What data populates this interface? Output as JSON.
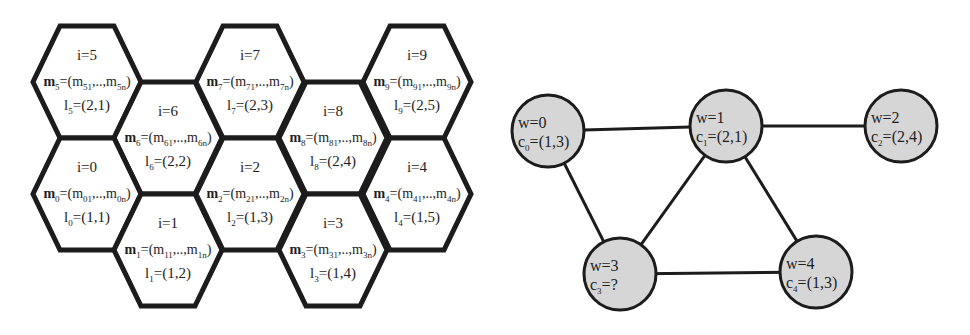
{
  "colors": {
    "stroke": "#1c1c1c",
    "node_fill": "#d6d6d6",
    "hex_fill": "#ffffff",
    "background": "#ffffff"
  },
  "hex_grid": {
    "geometry": {
      "half_width": 54,
      "half_height": 56,
      "top_half": 27
    },
    "cells": [
      {
        "i": "5",
        "cx": 87,
        "cy": 82,
        "i_label": "i=5",
        "m_sym": "m",
        "m_sub": "5",
        "m_rest": "=(m",
        "m_first": "51",
        "m_mid": ",..,m",
        "m_last": "5n",
        "m_close": ")",
        "l_sym": "l",
        "l_sub": "5",
        "l_val": "=(2,1)"
      },
      {
        "i": "6",
        "cx": 168,
        "cy": 138,
        "i_label": "i=6",
        "m_sym": "m",
        "m_sub": "6",
        "m_rest": "=(m",
        "m_first": "61",
        "m_mid": ",..,m",
        "m_last": "6n",
        "m_close": ")",
        "l_sym": "l",
        "l_sub": "6",
        "l_val": "=(2,2)"
      },
      {
        "i": "7",
        "cx": 250,
        "cy": 82,
        "i_label": "i=7",
        "m_sym": "m",
        "m_sub": "7",
        "m_rest": "=(m",
        "m_first": "71",
        "m_mid": ",..,m",
        "m_last": "7n",
        "m_close": ")",
        "l_sym": "l",
        "l_sub": "7",
        "l_val": "=(2,3)"
      },
      {
        "i": "8",
        "cx": 333,
        "cy": 138,
        "i_label": "i=8",
        "m_sym": "m",
        "m_sub": "8",
        "m_rest": "=(m",
        "m_first": "81",
        "m_mid": ",..,m",
        "m_last": "8n",
        "m_close": ")",
        "l_sym": "l",
        "l_sub": "8",
        "l_val": "=(2,4)"
      },
      {
        "i": "9",
        "cx": 417,
        "cy": 82,
        "i_label": "i=9",
        "m_sym": "m",
        "m_sub": "9",
        "m_rest": "=(m",
        "m_first": "91",
        "m_mid": ",..,m",
        "m_last": "9n",
        "m_close": ")",
        "l_sym": "l",
        "l_sub": "9",
        "l_val": "=(2,5)"
      },
      {
        "i": "0",
        "cx": 87,
        "cy": 194,
        "i_label": "i=0",
        "m_sym": "m",
        "m_sub": "0",
        "m_rest": "=(m",
        "m_first": "01",
        "m_mid": ",..,m",
        "m_last": "0n",
        "m_close": ")",
        "l_sym": "l",
        "l_sub": "0",
        "l_val": "=(1,1)"
      },
      {
        "i": "1",
        "cx": 168,
        "cy": 250,
        "i_label": "i=1",
        "m_sym": "m",
        "m_sub": "1",
        "m_rest": "=(m",
        "m_first": "11",
        "m_mid": ",..,m",
        "m_last": "1n",
        "m_close": ")",
        "l_sym": "l",
        "l_sub": "1",
        "l_val": "=(1,2)"
      },
      {
        "i": "2",
        "cx": 250,
        "cy": 194,
        "i_label": "i=2",
        "m_sym": "m",
        "m_sub": "2",
        "m_rest": "=(m",
        "m_first": "21",
        "m_mid": ",..,m",
        "m_last": "2n",
        "m_close": ")",
        "l_sym": "l",
        "l_sub": "2",
        "l_val": "=(1,3)"
      },
      {
        "i": "3",
        "cx": 333,
        "cy": 250,
        "i_label": "i=3",
        "m_sym": "m",
        "m_sub": "3",
        "m_rest": "=(m",
        "m_first": "31",
        "m_mid": ",..,m",
        "m_last": "3n",
        "m_close": ")",
        "l_sym": "l",
        "l_sub": "3",
        "l_val": "=(1,4)"
      },
      {
        "i": "4",
        "cx": 417,
        "cy": 194,
        "i_label": "i=4",
        "m_sym": "m",
        "m_sub": "4",
        "m_rest": "=(m",
        "m_first": "41",
        "m_mid": ",..,m",
        "m_last": "4n",
        "m_close": ")",
        "l_sym": "l",
        "l_sub": "4",
        "l_val": "=(1,5)"
      }
    ]
  },
  "graph": {
    "node_radius": 36,
    "nodes": [
      {
        "id": "0",
        "cx": 548,
        "cy": 131,
        "w_label": "w=0",
        "c_sym": "c",
        "c_sub": "0",
        "c_val": "=(1,3)"
      },
      {
        "id": "1",
        "cx": 726,
        "cy": 126,
        "w_label": "w=1",
        "c_sym": "c",
        "c_sub": "1",
        "c_val": "=(2,1)"
      },
      {
        "id": "2",
        "cx": 901,
        "cy": 126,
        "w_label": "w=2",
        "c_sym": "c",
        "c_sub": "2",
        "c_val": "=(2,4)"
      },
      {
        "id": "3",
        "cx": 620,
        "cy": 274,
        "w_label": "w=3",
        "c_sym": "c",
        "c_sub": "3",
        "c_val": "=?"
      },
      {
        "id": "4",
        "cx": 816,
        "cy": 272,
        "w_label": "w=4",
        "c_sym": "c",
        "c_sub": "4",
        "c_val": "=(1,3)"
      }
    ],
    "edges": [
      [
        "0",
        "1"
      ],
      [
        "1",
        "2"
      ],
      [
        "0",
        "3"
      ],
      [
        "1",
        "3"
      ],
      [
        "1",
        "4"
      ],
      [
        "3",
        "4"
      ]
    ]
  }
}
